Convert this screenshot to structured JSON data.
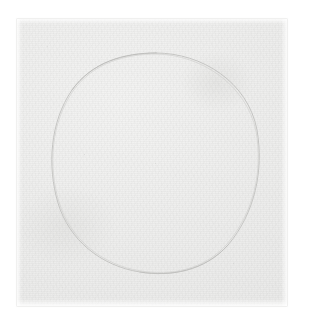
{
  "scene": {
    "title": "Scanned sheet of paper with a hand-drawn circle",
    "background_color": "#ffffff",
    "width": 311,
    "height": 324
  },
  "paper": {
    "name": "paper-sheet",
    "description": "Off-white textured paper sheet occupying most of the frame",
    "color": "#ededec",
    "edge_color": "#d7d7d5",
    "left": 17,
    "top": 19,
    "width": 270,
    "height": 287
  },
  "drawing": {
    "shape": "circle",
    "description": "Single faint hand-drawn pencil circle, slightly elliptical and uneven",
    "stroke_color": "#c4c4c2",
    "stroke_width": 1,
    "center_x": 156,
    "center_y": 163,
    "radius_x": 103,
    "radius_y": 110,
    "bounds": {
      "left": 53,
      "top": 53,
      "right": 259,
      "bottom": 274
    }
  },
  "marks": {
    "description": "Faint specks and graphite dust on the paper surface",
    "items": [
      {
        "name": "speck-center",
        "x": 155,
        "y": 163,
        "size": 1,
        "color": "#d2d2d0"
      },
      {
        "name": "speck-left-mid",
        "x": 84,
        "y": 154,
        "size": 1,
        "color": "#d4d4d2"
      },
      {
        "name": "speck-lower-right",
        "x": 233,
        "y": 263,
        "size": 1,
        "color": "#d0d0ce"
      },
      {
        "name": "speck-upper-left",
        "x": 47,
        "y": 46,
        "size": 1,
        "color": "#d9d9d7"
      },
      {
        "name": "speck-right-edge",
        "x": 271,
        "y": 118,
        "size": 1,
        "color": "#dadad8"
      },
      {
        "name": "speck-bottom-left",
        "x": 62,
        "y": 287,
        "size": 1,
        "color": "#d8d8d6"
      }
    ]
  }
}
